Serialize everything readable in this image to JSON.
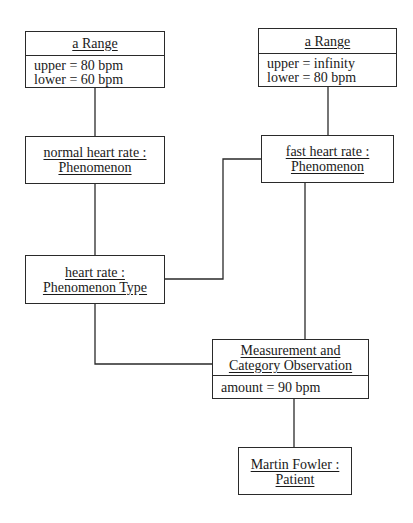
{
  "diagram": {
    "type": "UML object diagram",
    "objects": [
      {
        "id": "range_normal",
        "name_lines": [
          "a Range"
        ],
        "attributes": [
          "upper = 80 bpm",
          "lower = 60 bpm"
        ]
      },
      {
        "id": "range_fast",
        "name_lines": [
          "a Range"
        ],
        "attributes": [
          "upper = infinity",
          "lower = 80 bpm"
        ]
      },
      {
        "id": "normal_heart_rate",
        "name_lines": [
          "normal heart rate :",
          "Phenomenon"
        ],
        "attributes": []
      },
      {
        "id": "fast_heart_rate",
        "name_lines": [
          "fast heart rate :",
          "Phenomenon"
        ],
        "attributes": []
      },
      {
        "id": "heart_rate",
        "name_lines": [
          "heart rate :",
          "Phenomenon Type"
        ],
        "attributes": []
      },
      {
        "id": "measurement",
        "name_lines": [
          "Measurement and",
          "Category Observation"
        ],
        "attributes": [
          "amount = 90 bpm"
        ]
      },
      {
        "id": "patient",
        "name_lines": [
          "Martin Fowler :",
          "Patient"
        ],
        "attributes": []
      }
    ],
    "links": [
      {
        "from": "range_normal",
        "to": "normal_heart_rate"
      },
      {
        "from": "range_fast",
        "to": "fast_heart_rate"
      },
      {
        "from": "normal_heart_rate",
        "to": "heart_rate"
      },
      {
        "from": "fast_heart_rate",
        "to": "heart_rate"
      },
      {
        "from": "fast_heart_rate",
        "to": "measurement"
      },
      {
        "from": "heart_rate",
        "to": "measurement"
      },
      {
        "from": "measurement",
        "to": "patient"
      }
    ]
  }
}
